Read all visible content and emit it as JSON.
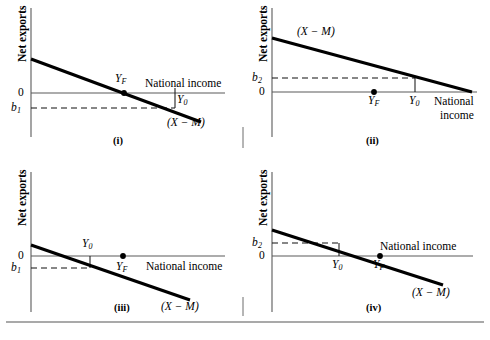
{
  "figure": {
    "type": "economics-diagram",
    "axis_labels": {
      "y": "Net exports",
      "x": "National income",
      "zero": "0"
    },
    "curve_label": "(X − M)",
    "colors": {
      "axis": "#5a5a5a",
      "curve": "#000000",
      "dash": "#111111",
      "background": "#ffffff"
    }
  },
  "panels": [
    {
      "tag": "(i)",
      "y_axis_label": "Net exports",
      "x_axis_label": "National income",
      "zero_label": "0",
      "curve_label": "(X − M)",
      "intercept_label": "b",
      "intercept_sub": "1",
      "points": [
        {
          "label": "Y",
          "sub": "F",
          "kind": "dot",
          "note": "full-employment income at zero net exports"
        },
        {
          "label": "Y",
          "sub": "0",
          "kind": "tick",
          "note": "equilibrium income with net export deficit"
        }
      ],
      "chart": {
        "y_intercept_sign": "positive",
        "zero_crossing": "at Y_F",
        "b_value_sign": "negative",
        "relation": "Y_F < Y_0"
      }
    },
    {
      "tag": "(ii)",
      "y_axis_label": "Net exports",
      "x_axis_label": "National income",
      "zero_label": "0",
      "curve_label": "(X − M)",
      "intercept_label": "b",
      "intercept_sub": "2",
      "points": [
        {
          "label": "Y",
          "sub": "F",
          "kind": "dot",
          "note": "full-employment income below zero crossing"
        },
        {
          "label": "Y",
          "sub": "0",
          "kind": "tick",
          "note": "equilibrium income with net export surplus"
        }
      ],
      "chart": {
        "y_intercept_sign": "positive",
        "zero_crossing": "right of Y_0",
        "b_value_sign": "positive",
        "relation": "Y_F < Y_0"
      }
    },
    {
      "tag": "(iii)",
      "y_axis_label": "Net exports",
      "x_axis_label": "National income",
      "zero_label": "0",
      "curve_label": "(X − M)",
      "intercept_label": "b",
      "intercept_sub": "1",
      "points": [
        {
          "label": "Y",
          "sub": "0",
          "kind": "tick",
          "note": "equilibrium income at net export deficit"
        },
        {
          "label": "Y",
          "sub": "F",
          "kind": "dot",
          "note": "full-employment income right of zero crossing"
        }
      ],
      "chart": {
        "y_intercept_sign": "positive",
        "zero_crossing": "left of Y_0",
        "b_value_sign": "negative",
        "relation": "Y_0 < Y_F"
      }
    },
    {
      "tag": "(iv)",
      "y_axis_label": "Net exports",
      "x_axis_label": "National income",
      "zero_label": "0",
      "curve_label": "(X − M)",
      "intercept_label": "b",
      "intercept_sub": "2",
      "points": [
        {
          "label": "Y",
          "sub": "0",
          "kind": "tick",
          "note": "equilibrium income with net export surplus"
        },
        {
          "label": "Y",
          "sub": "F",
          "kind": "dot",
          "note": "full-employment income at zero net exports"
        }
      ],
      "chart": {
        "y_intercept_sign": "positive",
        "zero_crossing": "at Y_F",
        "b_value_sign": "positive",
        "relation": "Y_0 < Y_F"
      }
    }
  ]
}
